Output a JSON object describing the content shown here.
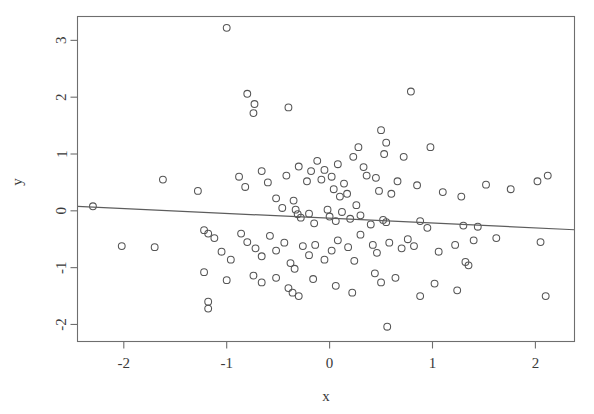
{
  "chart_data": {
    "type": "scatter",
    "title": "",
    "xlabel": "x",
    "ylabel": "y",
    "xlim": [
      -2.45,
      2.38
    ],
    "ylim": [
      -2.3,
      3.42
    ],
    "xticks": [
      -2,
      -1,
      0,
      1,
      2
    ],
    "xtick_labels": [
      "-2",
      "-1",
      "0",
      "1",
      "2"
    ],
    "yticks": [
      -2,
      -1,
      0,
      1,
      2,
      3
    ],
    "ytick_labels": [
      "-2",
      "-1",
      "0",
      "1",
      "2",
      "3"
    ],
    "grid": false,
    "legend": null,
    "marker": "open-circle",
    "marker_color": "#555555",
    "background": "#ffffff",
    "frame_color": "#6e6e6e",
    "n_points": 120,
    "fit_line": {
      "type": "linear-regression",
      "color": "#5d5d5d",
      "intercept": -0.13,
      "slope": -0.085,
      "x_start": -2.45,
      "y_start": 0.078,
      "x_end": 2.38,
      "y_end": -0.333
    },
    "points": [
      [
        -1.0,
        3.22
      ],
      [
        -0.8,
        2.06
      ],
      [
        -0.73,
        1.88
      ],
      [
        -0.74,
        1.72
      ],
      [
        -0.4,
        1.82
      ],
      [
        0.79,
        2.1
      ],
      [
        0.5,
        1.42
      ],
      [
        0.55,
        1.2
      ],
      [
        0.53,
        1.0
      ],
      [
        0.28,
        1.12
      ],
      [
        0.23,
        0.95
      ],
      [
        0.33,
        0.77
      ],
      [
        0.36,
        0.62
      ],
      [
        0.72,
        0.95
      ],
      [
        0.98,
        1.12
      ],
      [
        -1.62,
        0.55
      ],
      [
        -1.28,
        0.35
      ],
      [
        -0.88,
        0.6
      ],
      [
        -0.82,
        0.42
      ],
      [
        -0.66,
        0.7
      ],
      [
        -0.6,
        0.5
      ],
      [
        -0.52,
        0.22
      ],
      [
        -0.46,
        0.05
      ],
      [
        -0.42,
        0.62
      ],
      [
        -0.3,
        0.78
      ],
      [
        -0.22,
        0.52
      ],
      [
        -0.18,
        0.7
      ],
      [
        -0.12,
        0.88
      ],
      [
        -0.08,
        0.55
      ],
      [
        -0.05,
        0.72
      ],
      [
        0.02,
        0.6
      ],
      [
        0.04,
        0.38
      ],
      [
        0.08,
        0.82
      ],
      [
        0.1,
        0.25
      ],
      [
        0.14,
        0.48
      ],
      [
        0.17,
        0.3
      ],
      [
        0.45,
        0.58
      ],
      [
        0.48,
        0.35
      ],
      [
        0.6,
        0.3
      ],
      [
        0.66,
        0.52
      ],
      [
        0.85,
        0.45
      ],
      [
        1.1,
        0.33
      ],
      [
        1.28,
        0.25
      ],
      [
        1.52,
        0.46
      ],
      [
        1.76,
        0.38
      ],
      [
        2.02,
        0.52
      ],
      [
        2.12,
        0.62
      ],
      [
        -2.3,
        0.08
      ],
      [
        -0.35,
        0.18
      ],
      [
        -0.33,
        0.02
      ],
      [
        -0.31,
        -0.06
      ],
      [
        -0.28,
        -0.12
      ],
      [
        -0.2,
        -0.05
      ],
      [
        -0.15,
        -0.22
      ],
      [
        -0.02,
        0.02
      ],
      [
        0.0,
        -0.1
      ],
      [
        0.06,
        -0.18
      ],
      [
        0.12,
        -0.02
      ],
      [
        0.2,
        -0.14
      ],
      [
        0.26,
        0.1
      ],
      [
        0.3,
        -0.08
      ],
      [
        0.4,
        -0.24
      ],
      [
        0.52,
        -0.16
      ],
      [
        0.55,
        -0.2
      ],
      [
        0.88,
        -0.18
      ],
      [
        0.95,
        -0.3
      ],
      [
        1.3,
        -0.26
      ],
      [
        1.44,
        -0.28
      ],
      [
        -2.02,
        -0.62
      ],
      [
        -1.7,
        -0.64
      ],
      [
        -1.22,
        -0.34
      ],
      [
        -1.18,
        -0.4
      ],
      [
        -1.12,
        -0.48
      ],
      [
        -1.05,
        -0.72
      ],
      [
        -0.96,
        -0.86
      ],
      [
        -0.86,
        -0.4
      ],
      [
        -0.8,
        -0.55
      ],
      [
        -0.72,
        -0.66
      ],
      [
        -0.66,
        -0.8
      ],
      [
        -0.58,
        -0.44
      ],
      [
        -0.52,
        -0.7
      ],
      [
        -0.44,
        -0.56
      ],
      [
        -0.38,
        -0.92
      ],
      [
        -0.34,
        -1.02
      ],
      [
        -0.26,
        -0.62
      ],
      [
        -0.2,
        -0.78
      ],
      [
        -0.14,
        -0.6
      ],
      [
        -0.05,
        -0.86
      ],
      [
        0.02,
        -0.7
      ],
      [
        0.08,
        -0.52
      ],
      [
        0.18,
        -0.64
      ],
      [
        0.24,
        -0.88
      ],
      [
        0.3,
        -0.42
      ],
      [
        0.42,
        -0.6
      ],
      [
        0.46,
        -0.74
      ],
      [
        0.58,
        -0.56
      ],
      [
        0.7,
        -0.66
      ],
      [
        0.76,
        -0.5
      ],
      [
        0.82,
        -0.62
      ],
      [
        1.06,
        -0.72
      ],
      [
        1.22,
        -0.6
      ],
      [
        1.4,
        -0.52
      ],
      [
        1.62,
        -0.48
      ],
      [
        2.05,
        -0.55
      ],
      [
        -1.22,
        -1.08
      ],
      [
        -1.0,
        -1.22
      ],
      [
        -0.74,
        -1.14
      ],
      [
        -0.66,
        -1.26
      ],
      [
        -0.52,
        -1.18
      ],
      [
        -0.4,
        -1.36
      ],
      [
        -0.36,
        -1.44
      ],
      [
        -0.3,
        -1.5
      ],
      [
        -0.16,
        -1.2
      ],
      [
        0.06,
        -1.32
      ],
      [
        0.22,
        -1.44
      ],
      [
        0.44,
        -1.1
      ],
      [
        0.5,
        -1.26
      ],
      [
        0.64,
        -1.18
      ],
      [
        0.88,
        -1.5
      ],
      [
        1.02,
        -1.28
      ],
      [
        1.24,
        -1.4
      ],
      [
        -1.18,
        -1.6
      ],
      [
        -1.18,
        -1.72
      ],
      [
        0.56,
        -2.04
      ],
      [
        2.1,
        -1.5
      ],
      [
        1.32,
        -0.9
      ],
      [
        1.35,
        -0.96
      ]
    ]
  }
}
